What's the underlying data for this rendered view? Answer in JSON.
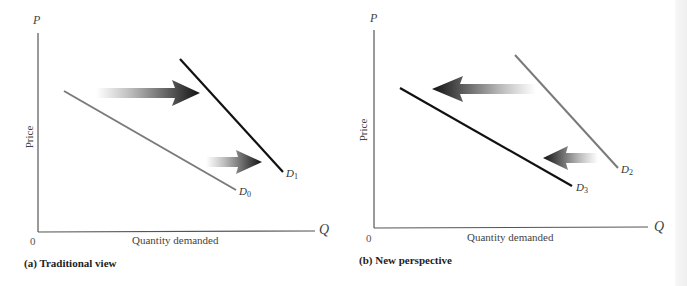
{
  "panels": [
    {
      "id": "a",
      "caption": "(a) Traditional view",
      "y_axis_var": "P",
      "y_axis_label": "Price",
      "x_axis_var": "Q",
      "x_axis_label": "Quantity demanded",
      "origin_label": "0",
      "curves": [
        {
          "name": "D",
          "sub": "0",
          "color": "#7a7a7a"
        },
        {
          "name": "D",
          "sub": "1",
          "color": "#111111"
        }
      ],
      "arrows": [
        {
          "direction": "right",
          "meaning": "demand shift outward (upper)"
        },
        {
          "direction": "right",
          "meaning": "demand shift outward (lower)"
        }
      ]
    },
    {
      "id": "b",
      "caption": "(b) New perspective",
      "y_axis_var": "P",
      "y_axis_label": "Price",
      "x_axis_var": "Q",
      "x_axis_label": "Quantity demanded",
      "origin_label": "0",
      "curves": [
        {
          "name": "D",
          "sub": "2",
          "color": "#7a7a7a"
        },
        {
          "name": "D",
          "sub": "3",
          "color": "#111111"
        }
      ],
      "arrows": [
        {
          "direction": "left",
          "meaning": "demand shift inward (upper)"
        },
        {
          "direction": "left",
          "meaning": "demand shift inward (lower)"
        }
      ]
    }
  ]
}
